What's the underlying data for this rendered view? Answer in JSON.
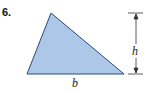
{
  "problem": {
    "number": "6.",
    "base_label": "b",
    "height_label": "h",
    "fill_color": "#a9c4e6",
    "stroke_color": "#2a4a7a"
  }
}
